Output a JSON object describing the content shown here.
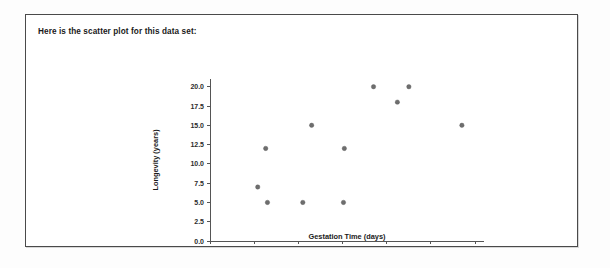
{
  "document": {
    "heading": "Here is the scatter plot for this data set:"
  },
  "chart_data": {
    "type": "scatter",
    "title": "",
    "xlabel": "Gestation Time (days)",
    "ylabel": "Longevity (years)",
    "xlim": [
      0,
      310
    ],
    "ylim": [
      0,
      21
    ],
    "xticks": [
      0,
      50,
      100,
      150,
      200,
      250,
      300
    ],
    "xticklabels": [
      "0",
      "50",
      "100",
      "150",
      "200",
      "250",
      "300"
    ],
    "yticks": [
      0.0,
      2.5,
      5.0,
      7.5,
      10.0,
      12.5,
      15.0,
      17.5,
      20.0
    ],
    "yticklabels": [
      "0.0",
      "2.5",
      "5.0",
      "7.5",
      "10.0",
      "12.5",
      "15.0",
      "17.5",
      "20.0"
    ],
    "grid": false,
    "legend": false,
    "marker": "circle",
    "marker_color": "#6e6e6e",
    "x": [
      54,
      63,
      65,
      105,
      115,
      151,
      152,
      185,
      212,
      225,
      285
    ],
    "y": [
      7.0,
      12.0,
      5.0,
      5.0,
      15.0,
      5.0,
      12.0,
      20.0,
      18.0,
      20.0,
      15.0
    ],
    "points": [
      {
        "x": 54,
        "y": 7.0
      },
      {
        "x": 63,
        "y": 12.0
      },
      {
        "x": 65,
        "y": 5.0
      },
      {
        "x": 105,
        "y": 5.0
      },
      {
        "x": 115,
        "y": 15.0
      },
      {
        "x": 151,
        "y": 5.0
      },
      {
        "x": 152,
        "y": 12.0
      },
      {
        "x": 185,
        "y": 20.0
      },
      {
        "x": 212,
        "y": 18.0
      },
      {
        "x": 225,
        "y": 20.0
      },
      {
        "x": 285,
        "y": 15.0
      }
    ]
  },
  "colors": {
    "frame_border": "#4a4a4a",
    "axis": "#555555",
    "text": "#1a1a1a",
    "marker": "#6e6e6e"
  }
}
